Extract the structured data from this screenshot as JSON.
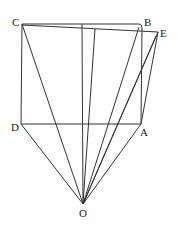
{
  "diagram": {
    "title": "",
    "points": {
      "C": {
        "label": "C",
        "x": 22,
        "y": 24
      },
      "B": {
        "label": "B",
        "x": 140,
        "y": 24
      },
      "E": {
        "label": "E",
        "x": 158,
        "y": 32
      },
      "D": {
        "label": "D",
        "x": 21,
        "y": 124
      },
      "A": {
        "label": "A",
        "x": 141,
        "y": 124
      },
      "O": {
        "label": "O",
        "x": 83,
        "y": 204
      }
    },
    "labels": {
      "C": "C",
      "B": "B",
      "E": "E",
      "D": "D",
      "A": "A",
      "O": "O"
    },
    "segments": [
      [
        "C",
        "B"
      ],
      [
        "C",
        "E"
      ],
      [
        "C",
        "D"
      ],
      [
        "D",
        "A"
      ],
      [
        "B",
        "A"
      ],
      [
        "E",
        "A"
      ],
      [
        "C",
        "O"
      ],
      [
        "D",
        "O"
      ],
      [
        "A",
        "O"
      ],
      [
        "B",
        "O"
      ],
      [
        "E",
        "O"
      ]
    ],
    "stroke_color": "#333333"
  }
}
